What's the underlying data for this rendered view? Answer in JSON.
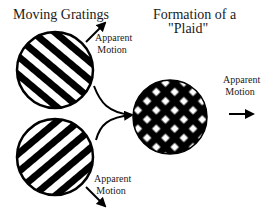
{
  "labels": {
    "moving_gratings": "Moving Gratings",
    "formation_line1": "Formation of a",
    "formation_line2": "\"Plaid\"",
    "top_motion_line1": "Apparent",
    "top_motion_line2": "Motion",
    "bottom_motion_line1": "Apparent",
    "bottom_motion_line2": "Motion",
    "right_motion_line1": "Apparent",
    "right_motion_line2": "Motion"
  },
  "colors": {
    "ink": "#000000",
    "background": "#ffffff"
  },
  "elements": {
    "top_grating": {
      "cx": 55,
      "cy": 70,
      "r": 38,
      "stripe_orientation": "down-right"
    },
    "bottom_grating": {
      "cx": 55,
      "cy": 157,
      "r": 38,
      "stripe_orientation": "up-right"
    },
    "plaid": {
      "cx": 170,
      "cy": 117,
      "r": 37
    }
  }
}
